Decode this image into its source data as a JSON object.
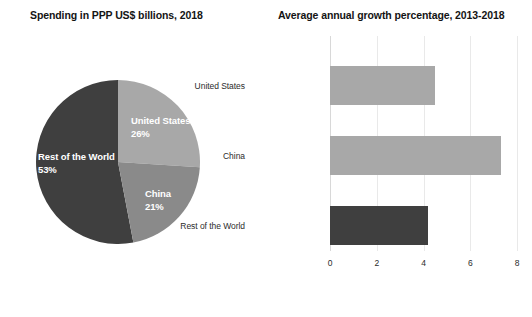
{
  "pie_panel": {
    "title": "Spending in PPP US$ billions, 2018"
  },
  "bar_panel": {
    "title": "Average annual growth percentage, 2013-2018"
  },
  "labels": {
    "us_name": "United States",
    "us_pct": "26%",
    "cn_name": "China",
    "cn_pct": "21%",
    "row_name": "Rest of the World",
    "row_pct": "53%",
    "cat_us": "United States",
    "cat_cn": "China",
    "cat_row": "Rest of the World"
  },
  "ticks": {
    "t0": "0",
    "t1": "2",
    "t2": "4",
    "t3": "6",
    "t4": "8"
  },
  "colors": {
    "light_gray": "#a8a8a8",
    "mid_gray": "#8a8a8a",
    "dark_gray": "#3f3f3f",
    "grid": "#e9e9e9",
    "text": "#1a1a1a"
  },
  "chart_data": [
    {
      "type": "pie",
      "title": "Spending in PPP US$ billions, 2018",
      "categories": [
        "United States",
        "China",
        "Rest of the World"
      ],
      "values": [
        26,
        21,
        53
      ],
      "unit": "percent",
      "value_labels": [
        "26%",
        "21%",
        "53%"
      ],
      "colors": [
        "#a8a8a8",
        "#8a8a8a",
        "#3f3f3f"
      ],
      "start_angle_deg": 0,
      "direction": "clockwise",
      "legend": "none",
      "labels_inside": true
    },
    {
      "type": "bar",
      "orientation": "horizontal",
      "title": "Average annual growth percentage, 2013-2018",
      "categories": [
        "United States",
        "China",
        "Rest of the World"
      ],
      "values": [
        4.5,
        7.3,
        4.2
      ],
      "colors": [
        "#a8a8a8",
        "#a8a8a8",
        "#3f3f3f"
      ],
      "xlabel": "",
      "ylabel": "",
      "xlim": [
        0,
        8
      ],
      "xticks": [
        0,
        2,
        4,
        6,
        8
      ],
      "grid": "vertical",
      "legend": "none"
    }
  ]
}
